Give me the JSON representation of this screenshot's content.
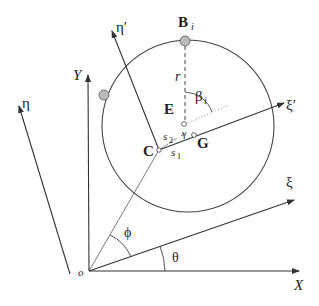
{
  "diagram": {
    "type": "geometry-coordinate-frames",
    "labels": {
      "origin": "o",
      "x_axis": "X",
      "y_axis": "Y",
      "xi": "ξ",
      "eta": "η",
      "xi_prime": "ξ′",
      "eta_prime": "η′",
      "point_c": "C",
      "point_e": "E",
      "point_g": "G",
      "point_b": "B",
      "point_b_sub": "i",
      "radius": "r",
      "beta": "β",
      "beta_sub": "i",
      "gamma": "γ",
      "s1": "s",
      "s1_sub": "1",
      "s2": "s",
      "s2_sub": "2",
      "theta": "θ",
      "phi": "ϕ"
    },
    "colors": {
      "line": "#333333",
      "dot_fill": "#bbbbbb",
      "text": "#222222"
    }
  }
}
